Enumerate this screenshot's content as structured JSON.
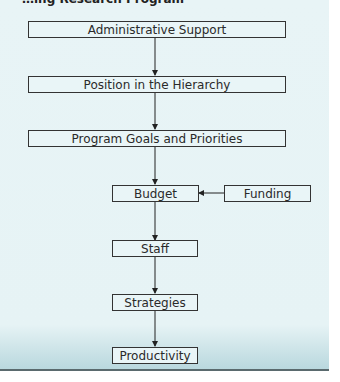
{
  "header": {
    "title": "…ing Research Program"
  },
  "diagram": {
    "nodes": [
      {
        "id": "admin",
        "label": "Administrative Support"
      },
      {
        "id": "position",
        "label": "Position in the Hierarchy"
      },
      {
        "id": "goals",
        "label": "Program Goals and Priorities"
      },
      {
        "id": "budget",
        "label": "Budget"
      },
      {
        "id": "funding",
        "label": "Funding"
      },
      {
        "id": "staff",
        "label": "Staff"
      },
      {
        "id": "strategies",
        "label": "Strategies"
      },
      {
        "id": "productivity",
        "label": "Productivity"
      }
    ],
    "edges": [
      {
        "from": "admin",
        "to": "position"
      },
      {
        "from": "position",
        "to": "goals"
      },
      {
        "from": "goals",
        "to": "budget"
      },
      {
        "from": "funding",
        "to": "budget"
      },
      {
        "from": "budget",
        "to": "staff"
      },
      {
        "from": "staff",
        "to": "strategies"
      },
      {
        "from": "strategies",
        "to": "productivity"
      }
    ]
  }
}
